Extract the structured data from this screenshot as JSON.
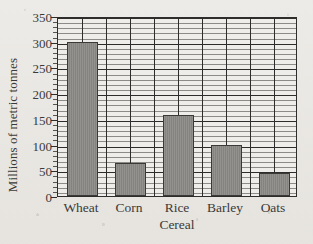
{
  "chart_data": {
    "type": "bar",
    "title": "",
    "xlabel": "Cereal",
    "ylabel": "Millions of metric tonnes",
    "categories": [
      "Wheat",
      "Corn",
      "Rice",
      "Barley",
      "Oats"
    ],
    "values": [
      300,
      64,
      158,
      100,
      45
    ],
    "ylim": [
      0,
      350
    ],
    "y_ticks": [
      0,
      50,
      100,
      150,
      200,
      250,
      300,
      350
    ],
    "y_tick_labels": [
      "0",
      "50",
      "100",
      "150",
      "200",
      "250",
      "300",
      "350"
    ],
    "y_minor_tick_step": 10,
    "grid": true,
    "grid_horizontal_minor": true,
    "grid_vertical_columns": 10,
    "legend": null,
    "bar_fill_color": "#8b8a87",
    "bar_border_color": "#3a3937",
    "plot_background_color": "#efedea",
    "axis_color": "#2e2d2b",
    "text_color": "#3b3a38",
    "page_background_color": "#eceae6"
  }
}
